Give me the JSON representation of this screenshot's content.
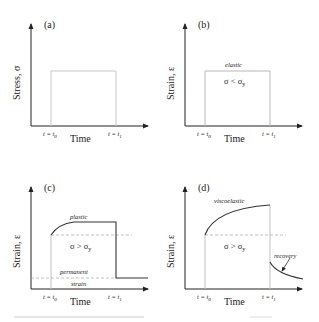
{
  "panels": [
    {
      "id": "a",
      "label": "(a)",
      "y_axis_label": "Stress, σ",
      "x_axis_label": "Time",
      "t0_label": "t = t",
      "t0_sub": "0",
      "t1_label": "t = t",
      "t1_sub": "1",
      "curve": "rectangular stress pulse from t0 to t1"
    },
    {
      "id": "b",
      "label": "(b)",
      "y_axis_label": "Strain, ε",
      "x_axis_label": "Time",
      "t0_label": "t = t",
      "t0_sub": "0",
      "t1_label": "t = t",
      "t1_sub": "1",
      "annotation": "elastic",
      "condition": "σ < σ",
      "condition_sub": "y",
      "curve": "rectangular strain pulse (elastic)"
    },
    {
      "id": "c",
      "label": "(c)",
      "y_axis_label": "Strain, ε",
      "x_axis_label": "Time",
      "t0_label": "t = t",
      "t0_sub": "0",
      "t1_label": "t = t",
      "t1_sub": "1",
      "annotation": "plastic",
      "condition": "σ > σ",
      "condition_sub": "y",
      "permanent_label_1": "permanent",
      "permanent_label_2": "strain",
      "curve": "jump, rise to plateau, drop to permanent strain"
    },
    {
      "id": "d",
      "label": "(d)",
      "y_axis_label": "Strain, ε",
      "x_axis_label": "Time",
      "t0_label": "t = t",
      "t0_sub": "0",
      "t1_label": "t = t",
      "t1_sub": "1",
      "annotation": "viscoelastic",
      "condition": "σ > σ",
      "condition_sub": "y",
      "recovery_label": "recovery",
      "curve": "jump then creep rise, drop then gradual recovery"
    }
  ],
  "colors": {
    "axis": "#222222",
    "curve": "#333333",
    "guide": "#bbbbbb",
    "dashed": "#999999",
    "caption": "#e2e2e2"
  }
}
